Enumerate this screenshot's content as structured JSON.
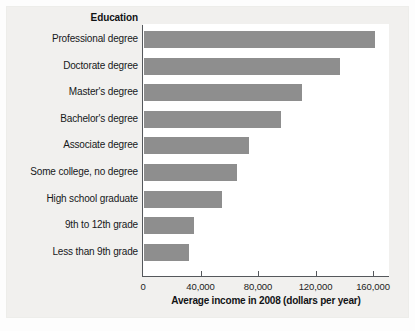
{
  "chart_data": {
    "type": "bar",
    "orientation": "horizontal",
    "title": "",
    "category_axis_title": "Education",
    "xlabel": "Average income in 2008 (dollars per year)",
    "ylabel": "Education",
    "xlim": [
      0,
      170000
    ],
    "xticks": [
      0,
      40000,
      80000,
      120000,
      160000
    ],
    "xtick_labels": [
      "0",
      "40,000",
      "80,000",
      "120,000",
      "160,000"
    ],
    "grid": false,
    "legend": null,
    "bar_color": "#8e8e8e",
    "plot_background": "#ffffff",
    "panel_background": "#f1f0ee",
    "axis_color": "#55585c",
    "categories": [
      "Professional degree",
      "Doctorate degree",
      "Master's degree",
      "Bachelor's degree",
      "Associate degree",
      "Some college, no degree",
      "High school graduate",
      "9th to 12th grade",
      "Less than 9th grade"
    ],
    "values": [
      161000,
      136000,
      110000,
      95000,
      73000,
      65000,
      54000,
      35000,
      31000
    ]
  }
}
